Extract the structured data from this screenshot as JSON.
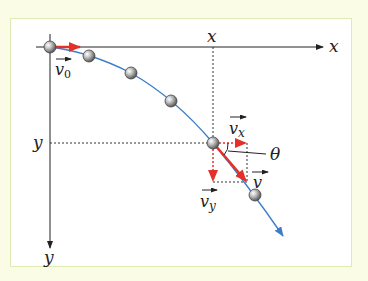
{
  "diagram": {
    "axes": {
      "x_axis_label": "x",
      "y_axis_label": "y",
      "x_marker_label": "x",
      "y_marker_label": "y"
    },
    "vectors": {
      "v0": {
        "label": "v",
        "subscript": "0"
      },
      "vx": {
        "label": "v",
        "subscript": "x"
      },
      "vy": {
        "label": "v",
        "subscript": "y"
      },
      "v": {
        "label": "v",
        "subscript": ""
      }
    },
    "angle_label": "θ",
    "colors": {
      "background": "#fbfce6",
      "panel": "#ffffff",
      "panel_border": "#dfe9b4",
      "trajectory": "#3d7cc9",
      "vector": "#e3312a",
      "axis": "#222222"
    },
    "ball_count": 6
  }
}
